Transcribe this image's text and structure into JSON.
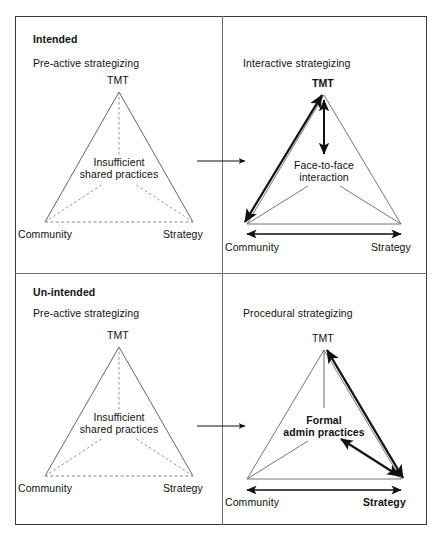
{
  "figure": {
    "type": "conceptual-2x2-diagram"
  },
  "quadrants": [
    {
      "id": "top-left",
      "header_bold": "Intended",
      "header_regular": "Pre-active strategizing",
      "triangle_style": "dashed-inner",
      "vertices": {
        "top": "TMT",
        "bottom_left": "Community",
        "bottom_right": "Strategy"
      },
      "center_label_line1": "Insufficient",
      "center_label_line2": "shared practices",
      "center_label_bold": false,
      "top_vertex_bold": false,
      "bottom_left_bold": false,
      "bottom_right_bold": false
    },
    {
      "id": "top-right",
      "header_bold": "",
      "header_regular": "Interactive strategizing",
      "triangle_style": "solid-with-bold-arrows",
      "vertices": {
        "top": "TMT",
        "bottom_left": "Community",
        "bottom_right": "Strategy"
      },
      "center_label_line1": "Face-to-face",
      "center_label_line2": "interaction",
      "center_label_bold": false,
      "top_vertex_bold": true,
      "bottom_left_bold": false,
      "bottom_right_bold": false,
      "emphasised_links": [
        "Community <-> TMT",
        "TMT <-> Face-to-face interaction",
        "Community <-> Strategy"
      ]
    },
    {
      "id": "bottom-left",
      "header_bold": "Un-intended",
      "header_regular": "Pre-active strategizing",
      "triangle_style": "dashed-inner",
      "vertices": {
        "top": "TMT",
        "bottom_left": "Community",
        "bottom_right": "Strategy"
      },
      "center_label_line1": "Insufficient",
      "center_label_line2": "shared practices",
      "center_label_bold": false,
      "top_vertex_bold": false,
      "bottom_left_bold": false,
      "bottom_right_bold": false
    },
    {
      "id": "bottom-right",
      "header_bold": "",
      "header_regular": "Procedural strategizing",
      "triangle_style": "solid-with-bold-arrows",
      "vertices": {
        "top": "TMT",
        "bottom_left": "Community",
        "bottom_right": "Strategy"
      },
      "center_label_line1": "Formal",
      "center_label_line2": "admin practices",
      "center_label_bold": true,
      "top_vertex_bold": false,
      "bottom_left_bold": false,
      "bottom_right_bold": true,
      "emphasised_links": [
        "TMT <-> Strategy",
        "Strategy <-> Formal admin practices",
        "Community <-> Strategy"
      ]
    }
  ],
  "connectors": [
    {
      "id": "top-connector",
      "from": "top-left",
      "to": "top-right",
      "style": "single-headed-arrow-right"
    },
    {
      "id": "bottom-connector",
      "from": "bottom-left",
      "to": "bottom-right",
      "style": "single-headed-arrow-right"
    }
  ],
  "colors": {
    "ink": "#111111",
    "frame": "#3a3a3a",
    "divider": "#6f6f6f",
    "thin_line": "#555555",
    "dashed_line": "#777777",
    "background": "#ffffff"
  }
}
